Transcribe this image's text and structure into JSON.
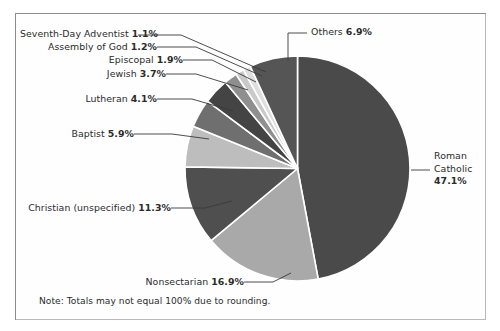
{
  "frame": {
    "border_color": "#8d8d8d",
    "background": "#ffffff"
  },
  "note": {
    "text": "Note: Totals may not equal 100% due to rounding."
  },
  "chart_data": {
    "type": "pie",
    "title": "",
    "subtitle": "",
    "xlabel": "",
    "ylabel": "",
    "grid": false,
    "legend_position": "none",
    "label_style": "outside-with-leader-lines",
    "units": "percent",
    "start_angle_deg": 0,
    "direction": "clockwise",
    "separator_color": "#ffffff",
    "note": "Note: Totals may not equal 100% due to rounding.",
    "categories": [
      "Roman Catholic",
      "Nonsectarian",
      "Christian (unspecified)",
      "Baptist",
      "Lutheran",
      "Jewish",
      "Episcopal",
      "Assembly of God",
      "Seventh-Day Adventist",
      "Others"
    ],
    "values": [
      47.1,
      16.9,
      11.3,
      5.9,
      4.1,
      3.7,
      1.9,
      1.2,
      1.1,
      6.9
    ],
    "value_labels": [
      "47.1%",
      "16.9%",
      "11.3%",
      "5.9%",
      "4.1%",
      "3.7%",
      "1.9%",
      "1.2%",
      "1.1%",
      "6.9%"
    ],
    "colors": [
      "#4a4a4a",
      "#a9a9a9",
      "#4f4f4f",
      "#bdbdbd",
      "#6f6f6f",
      "#444444",
      "#8f8f8f",
      "#c9c9c9",
      "#dedede",
      "#555555"
    ],
    "total": 100.1,
    "slices": [
      {
        "label": "Roman Catholic",
        "value": 47.1,
        "value_label": "47.1%",
        "color": "#4a4a4a"
      },
      {
        "label": "Nonsectarian",
        "value": 16.9,
        "value_label": "16.9%",
        "color": "#a9a9a9"
      },
      {
        "label": "Christian (unspecified)",
        "value": 11.3,
        "value_label": "11.3%",
        "color": "#4f4f4f"
      },
      {
        "label": "Baptist",
        "value": 5.9,
        "value_label": "5.9%",
        "color": "#bdbdbd"
      },
      {
        "label": "Lutheran",
        "value": 4.1,
        "value_label": "4.1%",
        "color": "#6f6f6f"
      },
      {
        "label": "Jewish",
        "value": 3.7,
        "value_label": "3.7%",
        "color": "#444444"
      },
      {
        "label": "Episcopal",
        "value": 1.9,
        "value_label": "1.9%",
        "color": "#8f8f8f"
      },
      {
        "label": "Assembly of God",
        "value": 1.2,
        "value_label": "1.2%",
        "color": "#c9c9c9"
      },
      {
        "label": "Seventh-Day Adventist",
        "value": 1.1,
        "value_label": "1.1%",
        "color": "#dedede"
      },
      {
        "label": "Others",
        "value": 6.9,
        "value_label": "6.9%",
        "color": "#555555"
      }
    ]
  },
  "labels": {
    "sda": {
      "name": "Seventh-Day Adventist",
      "pct": "1.1%"
    },
    "assembly": {
      "name": "Assembly of God",
      "pct": "1.2%"
    },
    "episcopal": {
      "name": "Episcopal",
      "pct": "1.9%"
    },
    "jewish": {
      "name": "Jewish",
      "pct": "3.7%"
    },
    "lutheran": {
      "name": "Lutheran",
      "pct": "4.1%"
    },
    "baptist": {
      "name": "Baptist",
      "pct": "5.9%"
    },
    "christian": {
      "name": "Christian (unspecified)",
      "pct": "11.3%"
    },
    "nonsect": {
      "name": "Nonsectarian",
      "pct": "16.9%"
    },
    "others": {
      "name": "Others",
      "pct": "6.9%"
    },
    "catholic": {
      "name_line1": "Roman",
      "name_line2": "Catholic",
      "pct": "47.1%"
    }
  }
}
